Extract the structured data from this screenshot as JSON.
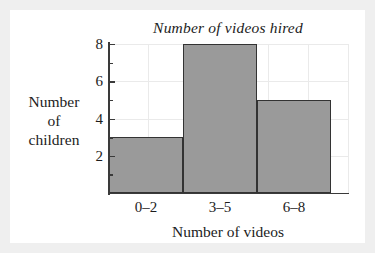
{
  "chart_data": {
    "type": "bar",
    "title": "Number of videos hired",
    "xlabel": "Number of videos",
    "ylabel_lines": [
      "Number",
      "of",
      "children"
    ],
    "ylabel": "Number of children",
    "categories": [
      "0–2",
      "3–5",
      "6–8"
    ],
    "values": [
      3,
      8,
      5
    ],
    "ylim": [
      0,
      8
    ],
    "ytick_labels": [
      "8",
      "6",
      "4",
      "2"
    ],
    "ytick_values": [
      8,
      6,
      4,
      2
    ],
    "minor_ticks": [
      1,
      3,
      5,
      7
    ],
    "grid": true,
    "legend": null,
    "bar_color": "#9a9a9a",
    "bar_edge_color": "#333333",
    "grid_color": "#eaeaea",
    "axis_color": "#3a3a3a",
    "background": "#ffffff",
    "page_background": "#efefef"
  }
}
